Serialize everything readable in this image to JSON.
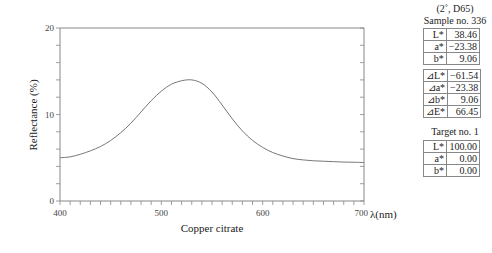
{
  "chart_data": {
    "type": "line",
    "title": "",
    "xlabel": "Copper citrate",
    "x_unit_label": "λ(nm)",
    "ylabel": "Reflectance (%)",
    "xlim": [
      400,
      700
    ],
    "ylim": [
      0,
      20
    ],
    "x_ticks": [
      400,
      500,
      600,
      700
    ],
    "y_ticks": [
      0,
      10,
      20
    ],
    "x_minor_step": 10,
    "y_minor_step": 2,
    "grid": false,
    "series": [
      {
        "name": "Copper citrate",
        "x": [
          400,
          410,
          420,
          430,
          440,
          450,
          460,
          470,
          480,
          490,
          500,
          510,
          520,
          530,
          540,
          550,
          560,
          570,
          580,
          590,
          600,
          610,
          620,
          630,
          640,
          650,
          660,
          670,
          680,
          690,
          700
        ],
        "values": [
          5.0,
          5.1,
          5.4,
          5.8,
          6.3,
          7.0,
          7.9,
          9.0,
          10.3,
          11.6,
          12.7,
          13.5,
          13.9,
          14.0,
          13.6,
          12.6,
          11.1,
          9.5,
          8.1,
          7.0,
          6.2,
          5.6,
          5.2,
          4.9,
          4.75,
          4.65,
          4.6,
          4.55,
          4.5,
          4.48,
          4.45
        ]
      }
    ]
  },
  "panel": {
    "conditions": "(2˚, D65)",
    "sample_title": "Sample no. 336",
    "sample_rows": [
      {
        "key": "L*",
        "value": "38.46"
      },
      {
        "key": "a*",
        "value": "−23.38"
      },
      {
        "key": "b*",
        "value": "9.06"
      }
    ],
    "diff_rows": [
      {
        "key": "⊿L*",
        "value": "−61.54"
      },
      {
        "key": "⊿a*",
        "value": "−23.38"
      },
      {
        "key": "⊿b*",
        "value": "9.06"
      },
      {
        "key": "⊿E*",
        "value": "66.45"
      }
    ],
    "target_title": "Target no. 1",
    "target_rows": [
      {
        "key": "L*",
        "value": "100.00"
      },
      {
        "key": "a*",
        "value": "0.00"
      },
      {
        "key": "b*",
        "value": "0.00"
      }
    ]
  }
}
